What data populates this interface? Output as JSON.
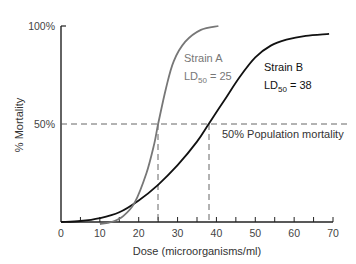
{
  "chart_data": {
    "type": "line",
    "title": "",
    "xlabel": "Dose (microorganisms/ml)",
    "ylabel": "% Mortality",
    "xlim": [
      0,
      70
    ],
    "ylim": [
      0,
      100
    ],
    "x_ticks": [
      0,
      10,
      20,
      30,
      40,
      50,
      60,
      70
    ],
    "x_minor_ticks": [
      5,
      15,
      25,
      35,
      45,
      55,
      65
    ],
    "y_tick_labels": [
      "50%",
      "100%"
    ],
    "grid": false,
    "series": [
      {
        "name": "Strain A",
        "color": "#777777",
        "ld50": 25,
        "points": [
          [
            10,
            -1
          ],
          [
            13,
            0
          ],
          [
            16,
            3
          ],
          [
            19,
            10
          ],
          [
            22,
            25
          ],
          [
            24,
            40
          ],
          [
            25,
            50
          ],
          [
            27,
            68
          ],
          [
            29,
            82
          ],
          [
            32,
            92
          ],
          [
            36,
            98
          ],
          [
            40.5,
            100
          ]
        ]
      },
      {
        "name": "Strain B",
        "color": "#111111",
        "ld50": 38,
        "points": [
          [
            0,
            0
          ],
          [
            5,
            0.5
          ],
          [
            10,
            2
          ],
          [
            15,
            5
          ],
          [
            20,
            11
          ],
          [
            25,
            19
          ],
          [
            30,
            29
          ],
          [
            35,
            41
          ],
          [
            38,
            50
          ],
          [
            42,
            62
          ],
          [
            46,
            74
          ],
          [
            50,
            84
          ],
          [
            54,
            90
          ],
          [
            58,
            93
          ],
          [
            63,
            95
          ],
          [
            69,
            96
          ]
        ]
      }
    ],
    "annotations": [
      {
        "text": "Strain A",
        "sub": "LD50 = 25"
      },
      {
        "text": "Strain B",
        "sub": "LD50 = 38"
      },
      {
        "text": "50% Population mortality",
        "y": 50
      }
    ],
    "reference_lines": {
      "horizontal_y": 50,
      "vertical_x": [
        25,
        38
      ]
    }
  },
  "labels": {
    "y_100": "100%",
    "y_50": "50%",
    "ylabel": "% Mortality",
    "xlabel": "Dose (microorganisms/ml)",
    "strainA_name": "Strain A",
    "strainA_ld": "LD",
    "strainA_sub": "50",
    "strainA_eq": " = 25",
    "strainB_name": "Strain B",
    "strainB_ld": "LD",
    "strainB_sub": "50",
    "strainB_eq": " = 38",
    "pop_mortality": "50% Population mortality",
    "x_ticks": [
      "0",
      "10",
      "20",
      "30",
      "40",
      "50",
      "60",
      "70"
    ]
  }
}
